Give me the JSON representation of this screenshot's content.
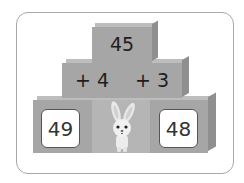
{
  "pyramid": {
    "top": {
      "value": "45"
    },
    "middle": [
      {
        "label": "+ 4"
      },
      {
        "label": "+ 3"
      }
    ],
    "bottom": [
      {
        "value": "49"
      },
      {
        "character": "rabbit"
      },
      {
        "value": "48"
      }
    ]
  },
  "colors": {
    "block": "#a6a6a6",
    "block_side": "#8f8f8f",
    "block_top": "#bdbdbd",
    "center_block": "#b5b5b5",
    "card_border": "#a8a8a8"
  }
}
